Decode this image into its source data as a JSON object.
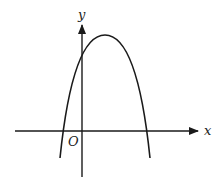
{
  "diagram": {
    "type": "function-graph",
    "labels": {
      "x_axis": "x",
      "y_axis": "y",
      "origin": "O"
    },
    "colors": {
      "stroke": "#1a1a1a",
      "background": "#ffffff"
    },
    "curve": {
      "shape": "parabola",
      "opens": "down",
      "vertex_quadrant": "I",
      "y_intercept": "positive",
      "x_intercepts": [
        "negative",
        "positive"
      ]
    }
  }
}
